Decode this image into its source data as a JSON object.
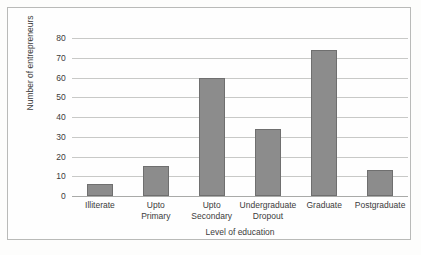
{
  "chart_data": {
    "type": "bar",
    "title": "",
    "xlabel": "Level of education",
    "ylabel": "Number of entrepreneurs",
    "categories": [
      "Illiterate",
      "Upto Primary",
      "Upto Secondary",
      "Undergraduate Dropout",
      "Graduate",
      "Postgraduate"
    ],
    "category_lines": [
      [
        "Illiterate"
      ],
      [
        "Upto",
        "Primary"
      ],
      [
        "Upto",
        "Secondary"
      ],
      [
        "Undergraduate",
        "Dropout"
      ],
      [
        "Graduate"
      ],
      [
        "Postgraduate"
      ]
    ],
    "values": [
      6,
      15,
      60,
      34,
      74,
      13
    ],
    "ylim": [
      0,
      80
    ],
    "yticks": [
      0,
      10,
      20,
      30,
      40,
      50,
      60,
      70,
      80
    ],
    "ytick_labels": [
      "0",
      "10",
      "20",
      "30",
      "40",
      "50",
      "60",
      "70",
      "80"
    ],
    "grid": true,
    "legend": false,
    "bar_color": "#8c8c8c",
    "bar_edge_color": "#6f6f6f",
    "gridline_color": "#c8c9c7",
    "frame_color": "#b9bab8",
    "background_color": "#fefefe",
    "text_color": "#3b3b3b"
  }
}
